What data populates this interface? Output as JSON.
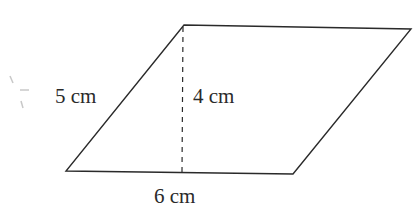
{
  "figure": {
    "shape": "parallelogram",
    "labels": {
      "side": "5 cm",
      "height": "4 cm",
      "base": "6 cm"
    },
    "colors": {
      "stroke": "#2a2a2a",
      "background": "#ffffff"
    }
  }
}
